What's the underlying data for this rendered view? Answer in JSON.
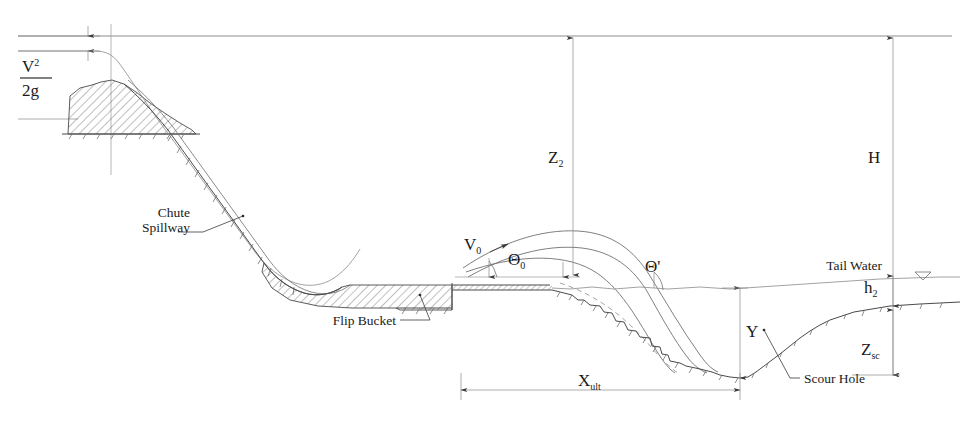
{
  "diagram": {
    "type": "engineering-section-schematic",
    "background_color": "#ffffff",
    "line_color": "#4a4a4a",
    "text_color": "#1a1a1a"
  },
  "labels": {
    "velocity_head": {
      "numerator": "V",
      "numerator_exponent": "2",
      "denominator": "2g"
    },
    "chute_spillway_line1": "Chute",
    "chute_spillway_line2": "Spillway",
    "flip_bucket": "Flip Bucket",
    "scour_hole": "Scour Hole",
    "tail_water": "Tail Water",
    "jet_velocity": "V",
    "jet_velocity_sub": "0",
    "jet_angle": "Θ",
    "jet_angle_sub": "0",
    "impact_angle": "Θ",
    "impact_angle_prime": "'",
    "drop_height": "Z",
    "drop_height_sub": "2",
    "total_head": "H",
    "scour_depth_below_bed": "Z",
    "scour_depth_below_bed_sub": "sc",
    "tailwater_depth": "h",
    "tailwater_depth_sub": "2",
    "scour_depth_total": "Y",
    "throw_distance": "X",
    "throw_distance_sub": "ult"
  },
  "icons": {
    "water_surface_symbol": "water-level-triangle-icon"
  },
  "elements": {
    "reservoir_level": "horizontal upper water surface line",
    "ogee_crest": "hatched ogee crest dam body",
    "chute_slope": "inclined chute spillway channel",
    "flip_bucket_block": "hatched concrete flip bucket structure",
    "jet_upper_nappe": "upper jet trajectory curve",
    "jet_lower_nappe": "lower jet trajectory curve",
    "jet_centerline": "dashed jet core centerline",
    "scour_profile": "irregular hatched riverbed scour profile",
    "tailwater_surface": "downstream tail water surface line"
  }
}
